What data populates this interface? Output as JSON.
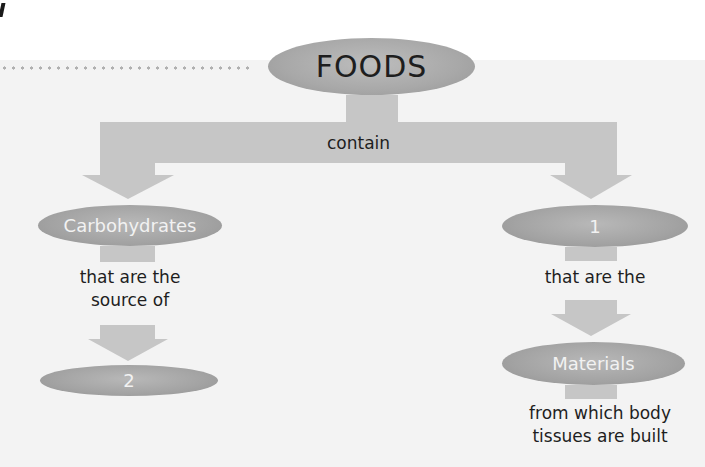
{
  "diagram": {
    "root": {
      "label": "FOODS",
      "relation": "contain"
    },
    "left_branch": {
      "node": "Carbohydrates",
      "relation_lines": [
        "that are the",
        "source of"
      ],
      "target": "2"
    },
    "right_branch": {
      "node": "1",
      "relation_lines": [
        "that are the"
      ],
      "target": "Materials",
      "target_description_lines": [
        "from which body",
        "tissues are built"
      ]
    }
  },
  "colors": {
    "shape_fill": "#c6c6c6",
    "oval_fill": "#a3a3a3",
    "text_dark": "#1e1e1e",
    "text_light": "#f2f2f2",
    "background": "#f3f3f3"
  }
}
